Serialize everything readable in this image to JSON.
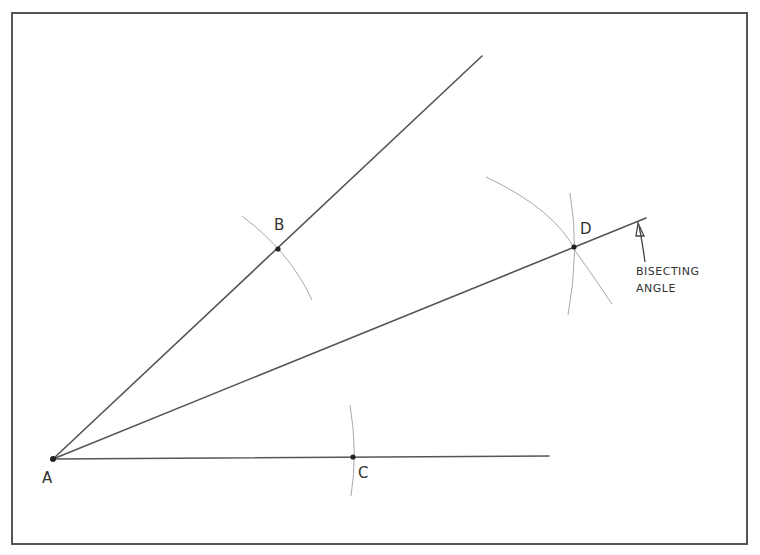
{
  "diagram": {
    "points": {
      "A": {
        "label": "A",
        "x": 53,
        "y": 459,
        "label_x": 42,
        "label_y": 483
      },
      "B": {
        "label": "B",
        "x": 278,
        "y": 249,
        "label_x": 274,
        "label_y": 230
      },
      "C": {
        "label": "C",
        "x": 353,
        "y": 457,
        "label_x": 358,
        "label_y": 478
      },
      "D": {
        "label": "D",
        "x": 574,
        "y": 247,
        "label_x": 580,
        "label_y": 234
      }
    },
    "rays": [
      {
        "name": "ray-AB",
        "from": "A",
        "x2": 482,
        "y2": 56
      },
      {
        "name": "ray-AC",
        "from": "A",
        "x2": 549,
        "y2": 456
      },
      {
        "name": "ray-AD-bisector",
        "from": "A",
        "x2": 646,
        "y2": 218
      }
    ],
    "annotation": {
      "line1": "BISECTING",
      "line2": "ANGLE"
    },
    "colors": {
      "line": "#555555",
      "arc": "#aaaaaa",
      "point": "#222222",
      "border": "#555555"
    }
  }
}
